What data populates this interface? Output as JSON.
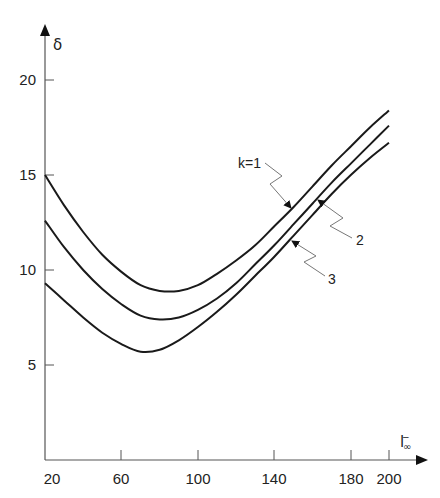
{
  "chart_data": {
    "type": "line",
    "title": "",
    "xlabel": "l∞",
    "ylabel": "δ",
    "xlim": [
      20,
      210
    ],
    "ylim": [
      0,
      22
    ],
    "grid": false,
    "legend": "inline annotations with arrows",
    "x_ticks": [
      20,
      60,
      100,
      140,
      180,
      200
    ],
    "y_ticks": [
      5,
      10,
      15,
      20
    ],
    "x": [
      20,
      30,
      40,
      50,
      60,
      70,
      80,
      90,
      100,
      110,
      120,
      130,
      140,
      150,
      160,
      170,
      180,
      190,
      200
    ],
    "series": [
      {
        "name": "k=1",
        "values": [
          15.0,
          13.4,
          12.0,
          10.8,
          9.9,
          9.2,
          8.9,
          8.9,
          9.2,
          9.8,
          10.5,
          11.3,
          12.3,
          13.3,
          14.4,
          15.5,
          16.5,
          17.5,
          18.4
        ]
      },
      {
        "name": "2",
        "values": [
          12.6,
          11.2,
          10.0,
          9.0,
          8.2,
          7.6,
          7.4,
          7.5,
          7.9,
          8.5,
          9.3,
          10.3,
          11.3,
          12.4,
          13.5,
          14.6,
          15.6,
          16.6,
          17.6
        ]
      },
      {
        "name": "3",
        "values": [
          9.3,
          8.4,
          7.5,
          6.7,
          6.1,
          5.7,
          5.8,
          6.3,
          7.0,
          7.8,
          8.7,
          9.7,
          10.7,
          11.8,
          12.9,
          14.0,
          15.0,
          15.9,
          16.7
        ]
      }
    ],
    "annotations": [
      {
        "text": "k=1",
        "target_series": "k=1",
        "at_x": 145
      },
      {
        "text": "2",
        "target_series": "2",
        "at_x": 155
      },
      {
        "text": "3",
        "target_series": "3",
        "at_x": 145
      }
    ]
  },
  "labels": {
    "y_axis": "δ",
    "x_axis_main": "l",
    "x_axis_sub": "∞",
    "x_axis_bar": "–",
    "x_ticks": [
      "20",
      "60",
      "100",
      "140",
      "180",
      "200"
    ],
    "y_ticks": [
      "20",
      "15",
      "10",
      "5"
    ],
    "annot_k1": "k=1",
    "annot_2": "2",
    "annot_3": "3"
  }
}
